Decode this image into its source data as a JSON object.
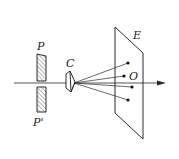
{
  "diagram": {
    "labels": {
      "plate_upper": "P",
      "plate_lower": "P'",
      "crystal": "C",
      "screen": "E",
      "origin": "O"
    },
    "colors": {
      "line": "#2a2a2a",
      "background": "#ffffff"
    }
  }
}
